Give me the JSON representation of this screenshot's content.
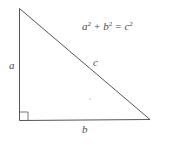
{
  "diagram": {
    "formula": {
      "a": "a",
      "a_exp": "2",
      "plus": "+",
      "b": "b",
      "b_exp": "2",
      "equals": "=",
      "c": "c",
      "c_exp": "2"
    },
    "labels": {
      "side_a": "a",
      "side_b": "b",
      "hypotenuse_c": "c"
    },
    "colors": {
      "stroke": "#555555",
      "text": "#4a4a4a",
      "background": "#ffffff"
    }
  }
}
